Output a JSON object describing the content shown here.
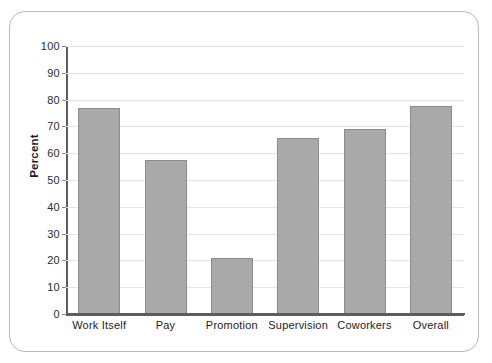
{
  "figure": {
    "frame_border_color": "#b9b9bd",
    "background": "#ffffff"
  },
  "chart_data": {
    "type": "bar",
    "title": "",
    "xlabel": "",
    "ylabel": "Percent",
    "ylim": [
      0,
      100
    ],
    "yticks": [
      0,
      10,
      20,
      30,
      40,
      50,
      60,
      70,
      80,
      90,
      100
    ],
    "ytick_labels": [
      "0",
      "10",
      "20",
      "30",
      "40",
      "50",
      "60",
      "70",
      "80",
      "90",
      "100"
    ],
    "grid": true,
    "legend": false,
    "categories": [
      "Work Itself",
      "Pay",
      "Promotion",
      "Supervision",
      "Coworkers",
      "Overall"
    ],
    "values": [
      77,
      57.5,
      21,
      65.5,
      69,
      77.5
    ],
    "bar_color": "#a9a9a9",
    "bar_edge_color": "#8c8c8c",
    "axis_color": "#5d5d5d",
    "gridline_color": "#e4e4e6"
  }
}
